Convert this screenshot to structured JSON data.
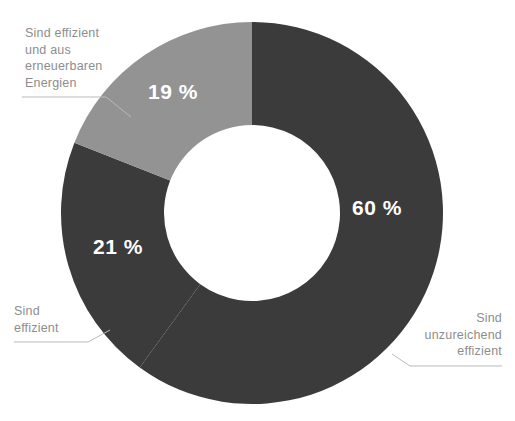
{
  "chart_data": {
    "type": "pie",
    "variant": "donut",
    "title": "",
    "subtitle": "",
    "xlabel": "",
    "ylabel": "",
    "legend_position": "none",
    "grid": false,
    "units": "%",
    "start_angle_deg": 0,
    "direction": "clockwise",
    "categories": [
      "Sind unzureichend effizient",
      "Sind effizient",
      "Sind effizient und aus erneuerbaren Energien"
    ],
    "values": [
      60,
      21,
      19
    ],
    "value_labels": [
      "60 %",
      "21 %",
      "19 %"
    ],
    "colors": [
      "#3b3b3b",
      "#3b3b3b",
      "#939393"
    ],
    "geometry": {
      "center_x": 252,
      "center_y": 213,
      "outer_radius": 191,
      "inner_radius": 88
    },
    "slices": [
      {
        "label": "Sind unzureichend effizient",
        "value": 60,
        "value_label": "60 %",
        "color": "#3b3b3b",
        "start_deg": 0,
        "end_deg": 216
      },
      {
        "label": "Sind effizient",
        "value": 21,
        "value_label": "21 %",
        "color": "#3b3b3b",
        "start_deg": 216,
        "end_deg": 291.6
      },
      {
        "label": "Sind effizient und aus erneuerbaren Energien",
        "value": 19,
        "value_label": "19 %",
        "color": "#939393",
        "start_deg": 291.6,
        "end_deg": 360
      }
    ]
  },
  "callouts": {
    "renewable": "Sind effizient\nund aus\nerneuerbaren\nEnergien",
    "efficient": "Sind\neffizient",
    "insufficient": "Sind\nunzureichend\neffizient"
  },
  "style": {
    "background": "#ffffff",
    "label_color": "#8d8d8d",
    "value_color": "#ffffff",
    "leader_line_color": "#b9b9b9",
    "dark_segment": "#3b3b3b",
    "light_segment": "#939393"
  }
}
